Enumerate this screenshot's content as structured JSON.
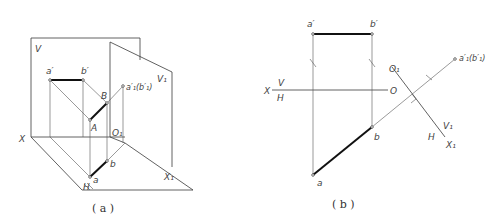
{
  "figure_a": {
    "caption": "( a )",
    "labels": {
      "V": "V",
      "V1": "V₁",
      "X": "X",
      "H": "H",
      "X1": "X₁",
      "O1": "O₁",
      "a_prime": "a′",
      "b_prime": "b′",
      "a1_b1": "a′₁(b′₁)",
      "A": "A",
      "B": "B",
      "a": "a",
      "b": "b"
    }
  },
  "figure_b": {
    "caption": "( b )",
    "labels": {
      "X": "X",
      "V": "V",
      "H": "H",
      "O": "O",
      "O1": "O₁",
      "V1": "V₁",
      "H2": "H",
      "X1": "X₁",
      "a_prime": "a′",
      "b_prime": "b′",
      "a1_b1": "a′₁(b′₁)",
      "a": "a",
      "b": "b"
    }
  }
}
